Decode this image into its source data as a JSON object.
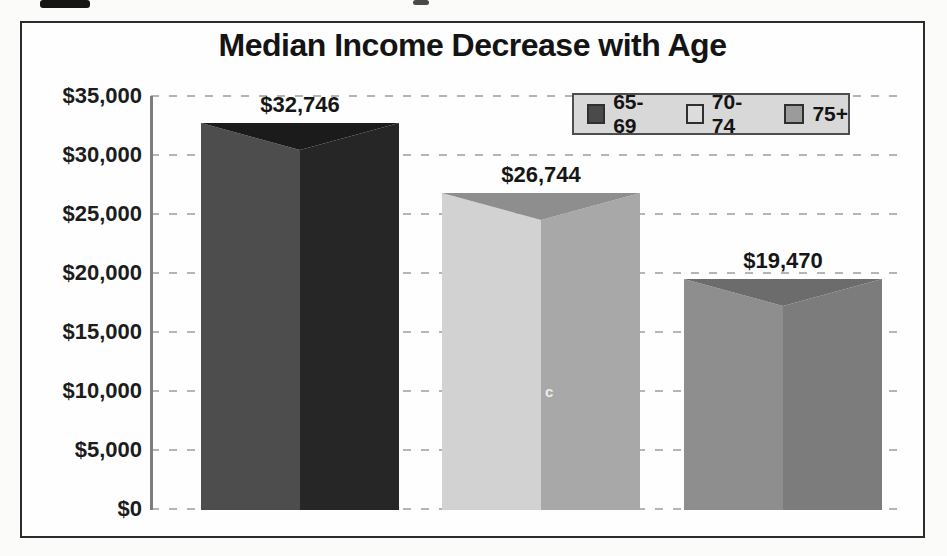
{
  "chart_data": {
    "type": "bar",
    "title": "Median Income Decrease with Age",
    "categories": [
      "65-69",
      "70-74",
      "75+"
    ],
    "values": [
      32746,
      26744,
      19470
    ],
    "xlabel": "",
    "ylabel": "",
    "ylim": [
      0,
      35000
    ],
    "ytick_interval": 5000,
    "ytick_labels": [
      "$35,000",
      "$30,000",
      "$25,000",
      "$20,000",
      "$15,000",
      "$10,000",
      "$5,000",
      "$0"
    ],
    "grid": "horizontal-dashed",
    "legend_position": "top-right",
    "bar_style": "3d-prism-front-ridge",
    "bars": [
      {
        "category": "65-69",
        "value": 32746,
        "label": "$32,746",
        "left_face_color": "#4d4d4d",
        "right_face_color": "#262626",
        "top_face_color": "#1b1b1b"
      },
      {
        "category": "70-74",
        "value": 26744,
        "label": "$26,744",
        "left_face_color": "#d2d2d2",
        "right_face_color": "#a8a8a8",
        "top_face_color": "#8e8e8e"
      },
      {
        "category": "75+",
        "value": 19470,
        "label": "$19,470",
        "left_face_color": "#8e8e8e",
        "right_face_color": "#7c7c7c",
        "top_face_color": "#6c6c6c"
      }
    ],
    "legend": [
      {
        "label": "65-69",
        "swatch_color": "#4a4a4a"
      },
      {
        "label": "70-74",
        "swatch_color": "#dcdcdc"
      },
      {
        "label": "75+",
        "swatch_color": "#9b9b9b"
      }
    ]
  },
  "artifacts": {
    "page_mark": "c"
  },
  "colors": {
    "frame_border": "#2c2c2c",
    "legend_background": "#d8d8d8",
    "gridline": "#b5b5b5",
    "axis_line": "#7d7d7d",
    "text": "#1a1a1a"
  }
}
